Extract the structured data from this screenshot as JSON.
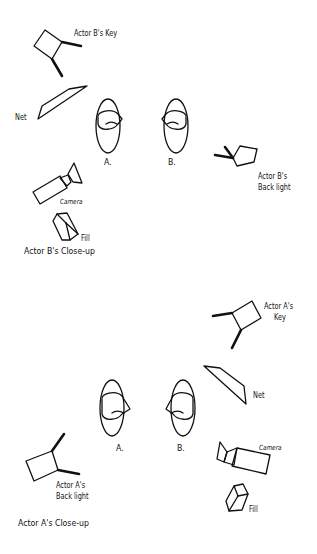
{
  "diagrams": [
    {
      "title": "Actor B's Close-up",
      "labels": {
        "key": "Actor B's Key",
        "net": "Net",
        "actor_a": "A.",
        "actor_b": "B.",
        "backlight_line1": "Actor B's",
        "backlight_line2": "Back light",
        "camera": "Camera",
        "fill": "Fill"
      }
    },
    {
      "title": "Actor A's Close-up",
      "labels": {
        "key_line1": "Actor A's",
        "key_line2": "Key",
        "net": "Net",
        "actor_a": "A.",
        "actor_b": "B.",
        "backlight_line1": "Actor A's",
        "backlight_line2": "Back light",
        "camera": "Camera",
        "fill": "Fill"
      }
    }
  ]
}
